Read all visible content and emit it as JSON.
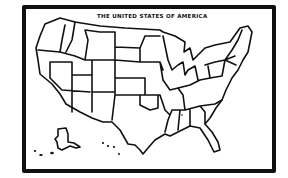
{
  "map": {
    "title": "THE UNITED STATES OF AMERICA",
    "style": "hand-drawn outline map",
    "ink_color": "#111111",
    "background_color": "#ffffff"
  }
}
